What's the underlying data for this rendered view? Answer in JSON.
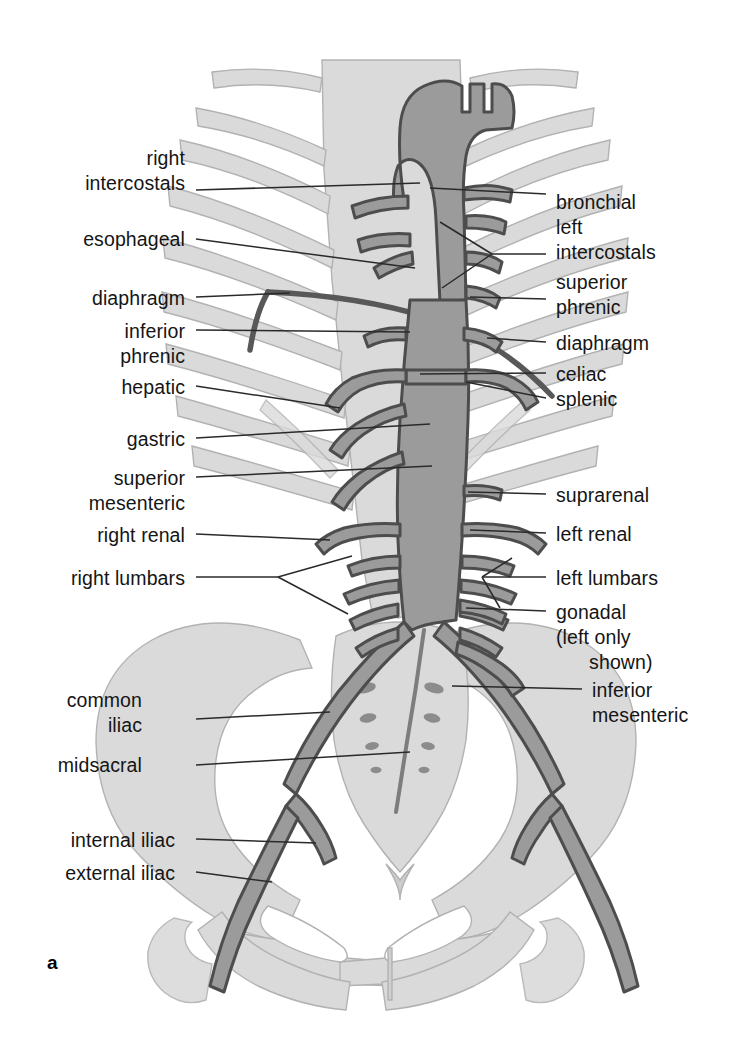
{
  "figure": {
    "letter": "a",
    "colors": {
      "background": "#ffffff",
      "vessel_fill": "#9b9b9b",
      "vessel_outline": "#4a4a4a",
      "bone_fill": "#d8d8d8",
      "bone_outline": "#a8a8a8",
      "diaphragm": "#606060",
      "leader_line": "#2a2a2a",
      "text": "#151515"
    }
  },
  "labels_left": [
    {
      "id": "right-intercostals",
      "lines": [
        "right",
        "intercostals"
      ],
      "x": 185,
      "y": 146,
      "leader_y": 190,
      "leader_to_x": 420,
      "leader_to_y": 183
    },
    {
      "id": "esophageal",
      "lines": [
        "esophageal"
      ],
      "x": 185,
      "y": 227,
      "leader_y": 239,
      "leader_to_x": 415,
      "leader_to_y": 228
    },
    {
      "id": "diaphragm-left",
      "lines": [
        "diaphragm"
      ],
      "x": 185,
      "y": 286,
      "leader_y": 297,
      "leader_to_x": 290,
      "leader_to_y": 293
    },
    {
      "id": "inferior-phrenic",
      "lines": [
        "inferior",
        "phrenic"
      ],
      "x": 185,
      "y": 319,
      "leader_y": 330,
      "leader_to_x": 410,
      "leader_to_y": 332
    },
    {
      "id": "hepatic",
      "lines": [
        "hepatic"
      ],
      "x": 185,
      "y": 375,
      "leader_y": 386,
      "leader_to_x": 415,
      "leader_to_y": 386
    },
    {
      "id": "gastric",
      "lines": [
        "gastric"
      ],
      "x": 185,
      "y": 427,
      "leader_y": 438,
      "leader_to_x": 425,
      "leader_to_y": 430
    },
    {
      "id": "superior-mesenteric",
      "lines": [
        "superior",
        "mesenteric"
      ],
      "x": 185,
      "y": 466,
      "leader_y": 477,
      "leader_to_x": 430,
      "leader_to_y": 473
    },
    {
      "id": "right-renal",
      "lines": [
        "right renal"
      ],
      "x": 185,
      "y": 523,
      "leader_y": 534,
      "leader_to_x": 330,
      "leader_to_y": 534
    },
    {
      "id": "right-lumbars",
      "lines": [
        "right lumbars"
      ],
      "x": 185,
      "y": 566,
      "leader_y": 577,
      "leader_to_x": 300,
      "leader_to_y": 577,
      "fork": true
    },
    {
      "id": "common-iliac",
      "lines": [
        "common",
        "iliac"
      ],
      "x": 142,
      "y": 688,
      "leader_y": 719,
      "leader_to_x": 330,
      "leader_to_y": 712
    },
    {
      "id": "midsacral",
      "lines": [
        "midsacral"
      ],
      "x": 142,
      "y": 753,
      "leader_y": 765,
      "leader_to_x": 360,
      "leader_to_y": 760
    },
    {
      "id": "internal-iliac",
      "lines": [
        "internal iliac"
      ],
      "x": 175,
      "y": 828,
      "leader_y": 839,
      "leader_to_x": 310,
      "leader_to_y": 843
    },
    {
      "id": "external-iliac",
      "lines": [
        "external iliac"
      ],
      "x": 175,
      "y": 861,
      "leader_y": 872,
      "leader_to_x": 282,
      "leader_to_y": 876
    }
  ],
  "labels_right": [
    {
      "id": "bronchial",
      "lines": [
        "bronchial"
      ],
      "x": 556,
      "y": 190,
      "leader_y": 194,
      "leader_to_x": 430,
      "leader_to_y": 193
    },
    {
      "id": "left-intercostals",
      "lines": [
        "left",
        "intercostals"
      ],
      "x": 556,
      "y": 215,
      "leader_y": 254,
      "leader_to_x": 460,
      "leader_to_y": 254,
      "fork": true
    },
    {
      "id": "superior-phrenic",
      "lines": [
        "superior",
        "phrenic"
      ],
      "x": 556,
      "y": 270,
      "leader_y": 299,
      "leader_to_x": 470,
      "leader_to_y": 297
    },
    {
      "id": "diaphragm-right",
      "lines": [
        "diaphragm"
      ],
      "x": 556,
      "y": 331,
      "leader_y": 342,
      "leader_to_x": 487,
      "leader_to_y": 338
    },
    {
      "id": "celiac",
      "lines": [
        "celiac"
      ],
      "x": 556,
      "y": 362,
      "leader_y": 373,
      "leader_to_x": 420,
      "leader_to_y": 374
    },
    {
      "id": "splenic",
      "lines": [
        "splenic"
      ],
      "x": 556,
      "y": 387,
      "leader_y": 398,
      "leader_to_x": 455,
      "leader_to_y": 394
    },
    {
      "id": "suprarenal",
      "lines": [
        "suprarenal"
      ],
      "x": 556,
      "y": 483,
      "leader_y": 494,
      "leader_to_x": 432,
      "leader_to_y": 492
    },
    {
      "id": "left-renal",
      "lines": [
        "left renal"
      ],
      "x": 556,
      "y": 522,
      "leader_y": 533,
      "leader_to_x": 437,
      "leader_to_y": 531
    },
    {
      "id": "left-lumbars",
      "lines": [
        "left lumbars"
      ],
      "x": 556,
      "y": 566,
      "leader_y": 577,
      "leader_to_x": 452,
      "leader_to_y": 577,
      "fork": true
    },
    {
      "id": "gonadal",
      "lines": [
        "gonadal",
        "(left only",
        "      shown)"
      ],
      "x": 556,
      "y": 600,
      "leader_y": 611,
      "leader_to_x": 430,
      "leader_to_y": 611
    },
    {
      "id": "inferior-mesenteric",
      "lines": [
        "inferior",
        "mesenteric"
      ],
      "x": 592,
      "y": 678,
      "leader_y": 689,
      "leader_to_x": 452,
      "leader_to_y": 686
    }
  ]
}
